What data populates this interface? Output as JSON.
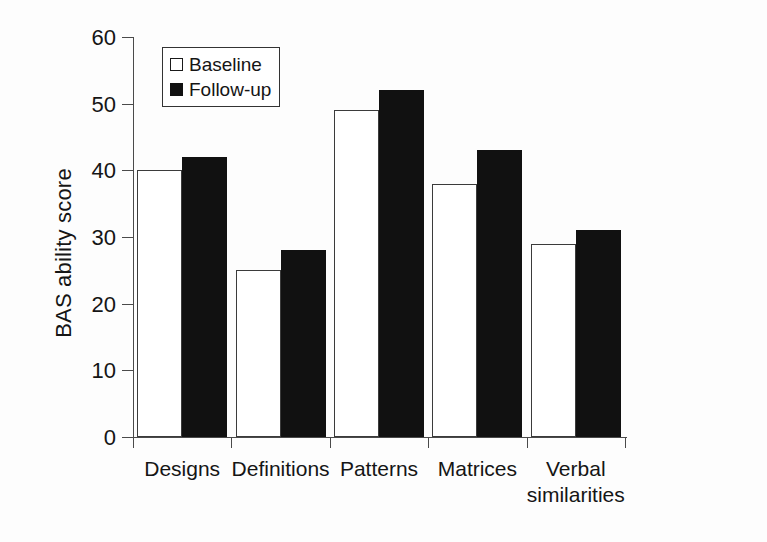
{
  "chart_data": {
    "type": "bar",
    "title": "",
    "subtitle": "",
    "xlabel": "",
    "ylabel": "BAS ability score",
    "ylim": [
      0,
      60
    ],
    "yticks": [
      0,
      10,
      20,
      30,
      40,
      50,
      60
    ],
    "ytick_labels": [
      "0",
      "10",
      "20",
      "30",
      "40",
      "50",
      "60"
    ],
    "grid": false,
    "legend_position": "upper-left-inside",
    "categories": [
      "Designs",
      "Definitions",
      "Patterns",
      "Matrices",
      "Verbal similarities"
    ],
    "category_labels": [
      {
        "line1": "Designs",
        "line2": ""
      },
      {
        "line1": "Definitions",
        "line2": ""
      },
      {
        "line1": "Patterns",
        "line2": ""
      },
      {
        "line1": "Matrices",
        "line2": ""
      },
      {
        "line1": "Verbal",
        "line2": "similarities"
      }
    ],
    "series": [
      {
        "name": "Baseline",
        "values": [
          40,
          25,
          49,
          38,
          29
        ],
        "color": "#ffffff",
        "edge_color": "#3b3b3b"
      },
      {
        "name": "Follow-up",
        "values": [
          42,
          28,
          52,
          43,
          31
        ],
        "color": "#111111",
        "edge_color": "#111111"
      }
    ]
  },
  "legend": {
    "items": [
      {
        "label": "Baseline",
        "swatch": "open-square-swatch"
      },
      {
        "label": "Follow-up",
        "swatch": "filled-square-swatch"
      }
    ]
  },
  "axis": {
    "y_title": "BAS ability score"
  }
}
